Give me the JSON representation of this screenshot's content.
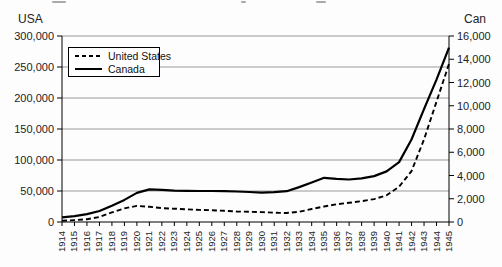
{
  "figure": {
    "background": "#fdfdfd",
    "note": "cropped text fragments visible along top edge"
  },
  "colors": {
    "line": "#000000",
    "grid": "#999999",
    "axis": "#000000",
    "text": "#222222",
    "legend_bg": "#ffffff"
  },
  "chart_data": {
    "type": "line",
    "title": "",
    "x": [
      "1914",
      "1915",
      "1916",
      "1917",
      "1918",
      "1919",
      "1920",
      "1921",
      "1922",
      "1923",
      "1924",
      "1925",
      "1926",
      "1927",
      "1928",
      "1929",
      "1930",
      "1931",
      "1932",
      "1933",
      "1934",
      "1935",
      "1936",
      "1937",
      "1938",
      "1939",
      "1940",
      "1941",
      "1942",
      "1943",
      "1944",
      "1945"
    ],
    "series": [
      {
        "name": "United States",
        "axis": "left",
        "line_style": "dashed",
        "color": "#000000",
        "values": [
          2000,
          3000,
          4500,
          8000,
          15500,
          22000,
          26000,
          24500,
          22500,
          21500,
          20500,
          19500,
          19000,
          18000,
          17000,
          16500,
          16000,
          15000,
          14500,
          16500,
          21000,
          25000,
          28500,
          31000,
          33500,
          37000,
          43000,
          57000,
          82000,
          133000,
          194000,
          255000
        ]
      },
      {
        "name": "Canada",
        "axis": "right",
        "line_style": "solid",
        "color": "#000000",
        "values": [
          400,
          500,
          680,
          950,
          1400,
          1900,
          2500,
          2800,
          2760,
          2700,
          2680,
          2670,
          2670,
          2650,
          2620,
          2580,
          2520,
          2560,
          2650,
          3000,
          3400,
          3800,
          3720,
          3660,
          3760,
          3950,
          4350,
          5150,
          7100,
          9700,
          12250,
          15000
        ]
      }
    ],
    "left_axis": {
      "title": "USA",
      "range": [
        0,
        300000
      ],
      "tick_step": 50000,
      "tick_labels": [
        "0",
        "50,000",
        "100,000",
        "150,000",
        "200,000",
        "250,000",
        "300,000"
      ]
    },
    "right_axis": {
      "title": "Can",
      "range": [
        0,
        16000
      ],
      "tick_step": 2000,
      "tick_labels": [
        "0",
        "2,000",
        "4,000",
        "6,000",
        "8,000",
        "10,000",
        "12,000",
        "14,000",
        "16,000"
      ]
    },
    "grid": "horizontal",
    "legend_position": "top-left-inside"
  }
}
